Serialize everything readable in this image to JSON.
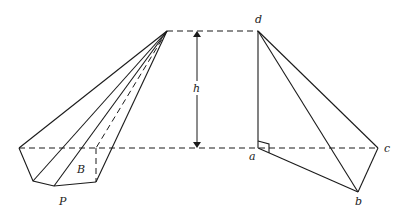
{
  "diagram": {
    "type": "geometry-pyramids",
    "labels": {
      "height": "h",
      "base": "B",
      "left_solid": "P",
      "vertex_a": "a",
      "vertex_b": "b",
      "vertex_c": "c",
      "vertex_d": "d"
    },
    "colors": {
      "stroke": "#1a1a1a",
      "background": "#ffffff"
    },
    "left_pyramid": {
      "apex": [
        167,
        31
      ],
      "base_vertices": [
        [
          19,
          148
        ],
        [
          33,
          181
        ],
        [
          54,
          186
        ],
        [
          96,
          182
        ],
        [
          96,
          148
        ]
      ],
      "hidden_edges": [
        "apex-to-(96,148)",
        "(96,148)-to-(96,182)",
        "(19,148)-to-(96,148)"
      ]
    },
    "right_tetrahedron": {
      "d": [
        258,
        31
      ],
      "a": [
        258,
        148
      ],
      "b": [
        358,
        192
      ],
      "c": [
        378,
        148
      ],
      "right_angle_at": "a"
    },
    "height_arrow": {
      "x": 197,
      "y_top": 31,
      "y_bottom": 148
    },
    "reference_lines": {
      "top_y": 31,
      "base_y": 148
    }
  }
}
